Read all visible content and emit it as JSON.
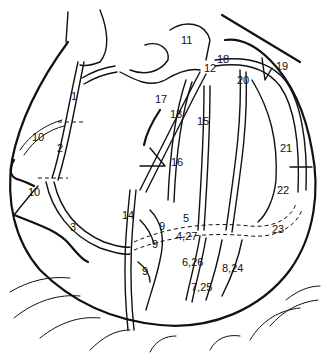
{
  "figure": {
    "labels": [
      {
        "id": "seg-1",
        "text": "1"
      },
      {
        "id": "seg-2-rca",
        "text": "2"
      },
      {
        "id": "seg-3",
        "text": "3"
      },
      {
        "id": "seg-10-upper",
        "text": "10"
      },
      {
        "id": "seg-10-lower",
        "text": "10"
      },
      {
        "id": "seg-11",
        "text": "11"
      },
      {
        "id": "seg-12",
        "text": "12"
      },
      {
        "id": "seg-18",
        "text": "18"
      },
      {
        "id": "seg-19",
        "text": "19"
      },
      {
        "id": "seg-20",
        "text": "20"
      },
      {
        "id": "seg-17",
        "text": "17"
      },
      {
        "id": "seg-13",
        "text": "13"
      },
      {
        "id": "seg-15",
        "text": "15"
      },
      {
        "id": "seg-16",
        "text": "16"
      },
      {
        "id": "seg-21",
        "text": "21"
      },
      {
        "id": "seg-22",
        "text": "22"
      },
      {
        "id": "seg-23",
        "text": "23"
      },
      {
        "id": "seg-14",
        "text": "14"
      },
      {
        "id": "seg-9a",
        "text": "9"
      },
      {
        "id": "seg-9b",
        "text": "9"
      },
      {
        "id": "seg-9c",
        "text": "9"
      },
      {
        "id": "seg-5",
        "text": "5"
      },
      {
        "id": "seg-4-27",
        "text": "4,27"
      },
      {
        "id": "seg-6-26",
        "text": "6,26"
      },
      {
        "id": "seg-7-25",
        "text": "7,25"
      },
      {
        "id": "seg-8-24",
        "text": "8,24"
      }
    ]
  }
}
